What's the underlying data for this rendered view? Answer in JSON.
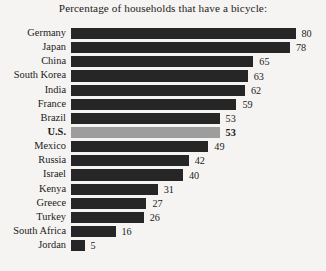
{
  "chart_data": {
    "type": "bar",
    "title": "Percentage of households that have a bicycle:",
    "xlabel": "",
    "ylabel": "",
    "orientation": "horizontal",
    "grid": false,
    "legend": false,
    "xlim": [
      0,
      80
    ],
    "categories": [
      "Germany",
      "Japan",
      "China",
      "South Korea",
      "India",
      "France",
      "Brazil",
      "U.S.",
      "Mexico",
      "Russia",
      "Israel",
      "Kenya",
      "Greece",
      "Turkey",
      "South Africa",
      "Jordan"
    ],
    "values": [
      80,
      78,
      65,
      63,
      62,
      59,
      53,
      53,
      49,
      42,
      40,
      31,
      27,
      26,
      16,
      5
    ],
    "highlighted_category": "U.S.",
    "bar_color": "#262626",
    "highlight_bar_color": "#9d9d9d",
    "background_color": "#f5f4f2",
    "text_color": "#1b1b1b"
  }
}
